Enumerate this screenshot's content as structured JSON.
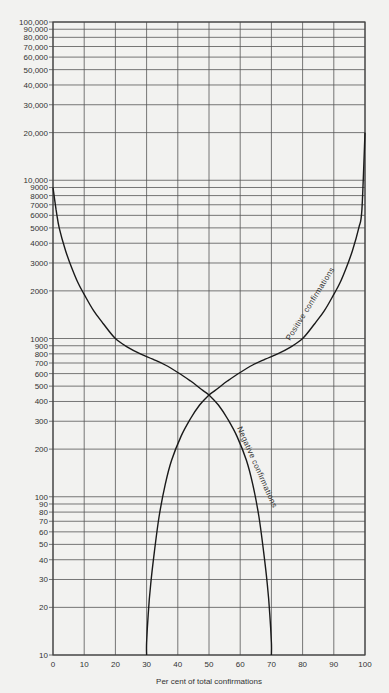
{
  "chart_data": {
    "type": "line",
    "title": "",
    "xlabel": "Per cent of total confirmations",
    "ylabel": "",
    "xlim": [
      0,
      100
    ],
    "ylim": [
      10,
      100000
    ],
    "yscale": "log",
    "grid": true,
    "x_ticks": [
      0,
      10,
      20,
      30,
      40,
      50,
      60,
      70,
      80,
      90,
      100
    ],
    "x_tick_labels": [
      "0",
      "10",
      "20",
      "30",
      "40",
      "50",
      "60",
      "70",
      "80",
      "90",
      "100"
    ],
    "y_ticks": [
      10,
      20,
      30,
      40,
      50,
      60,
      70,
      80,
      90,
      100,
      200,
      300,
      400,
      500,
      600,
      700,
      800,
      900,
      1000,
      2000,
      3000,
      4000,
      5000,
      6000,
      7000,
      8000,
      9000,
      10000,
      20000,
      30000,
      40000,
      50000,
      60000,
      70000,
      80000,
      90000,
      100000
    ],
    "y_tick_labels": [
      "10",
      "20",
      "30",
      "40",
      "50",
      "60",
      "70",
      "80",
      "90",
      "100",
      "200",
      "300",
      "400",
      "500",
      "600",
      "700",
      "800",
      "900",
      "1000",
      "2000",
      "3000",
      "4000",
      "5000",
      "6000",
      "7000",
      "8000",
      "9000",
      "10,000",
      "20,000",
      "30,000",
      "40,000",
      "50,000",
      "60,000",
      "70,000",
      "80,000",
      "90,000",
      "100,000"
    ],
    "series": [
      {
        "name": "Negative confirmations",
        "x": [
          0,
          1,
          2,
          4,
          6,
          8,
          10,
          13,
          16,
          20,
          24,
          28,
          32,
          36,
          40,
          44,
          48,
          50,
          53,
          56,
          59,
          62,
          64,
          66,
          67.5,
          68.7,
          69.5,
          70,
          70
        ],
        "y": [
          9000,
          6500,
          5000,
          3600,
          2800,
          2250,
          1900,
          1500,
          1250,
          1000,
          880,
          800,
          740,
          680,
          610,
          540,
          470,
          440,
          380,
          310,
          240,
          170,
          120,
          75,
          45,
          28,
          18,
          12,
          10
        ]
      },
      {
        "name": "Positive confirmations",
        "x": [
          30,
          30,
          30.5,
          31.3,
          32.5,
          34,
          36,
          38,
          41,
          44,
          47,
          50,
          52,
          56,
          60,
          64,
          68,
          72,
          76,
          80,
          84,
          87,
          90,
          92,
          94,
          96,
          98,
          99,
          100
        ],
        "y": [
          10,
          12,
          18,
          28,
          45,
          75,
          120,
          170,
          240,
          310,
          380,
          440,
          470,
          540,
          610,
          680,
          740,
          800,
          880,
          1000,
          1250,
          1500,
          1900,
          2250,
          2800,
          3600,
          5000,
          6500,
          20000
        ]
      }
    ],
    "annotations": [
      {
        "text": "Positive confirmations",
        "x": 85,
        "y": 1300
      },
      {
        "text": "Negative confirmations",
        "x": 62,
        "y": 180
      }
    ]
  },
  "labels": {
    "xlabel": "Per cent of total confirmations",
    "positive": "Positive confirmations",
    "negative": "Negative confirmations"
  }
}
